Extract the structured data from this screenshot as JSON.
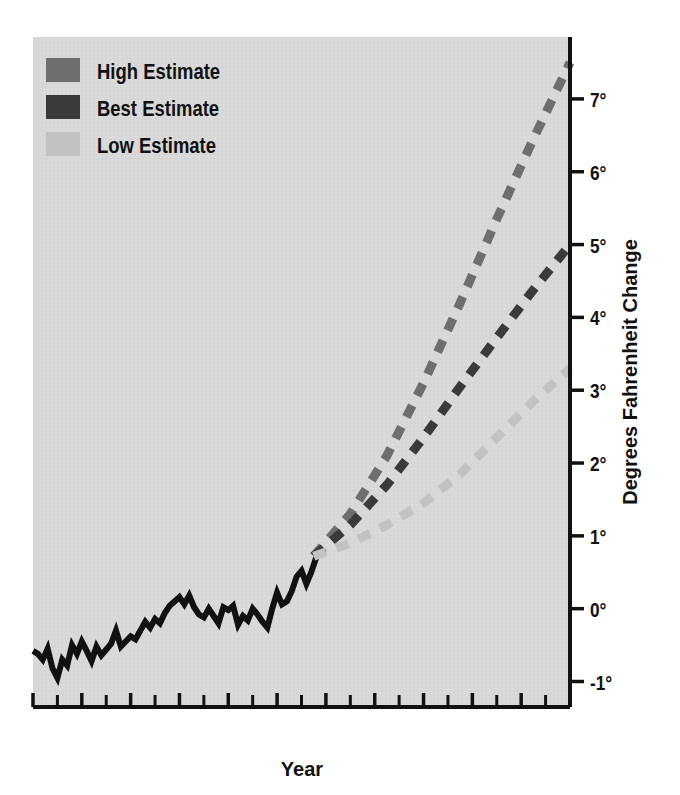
{
  "chart_data": {
    "type": "line",
    "title": "",
    "xlabel": "Year",
    "ylabel": "Degrees Fahrenheit Change",
    "xlim": [
      1880,
      2100
    ],
    "ylim": [
      -1.35,
      7.85
    ],
    "grid": false,
    "legend_position": "top-left",
    "background_color": "#d8d8d8",
    "x_tick_labels": [
      "1880",
      "1900",
      "'20",
      "'40",
      "'60",
      "'80",
      "2000",
      "'20",
      "'40",
      "'60",
      "'80",
      "2100"
    ],
    "x_tick_values": [
      1880,
      1900,
      1920,
      1940,
      1960,
      1980,
      2000,
      2020,
      2040,
      2060,
      2080,
      2100
    ],
    "x_minor_tick_values": [
      1890,
      1910,
      1930,
      1950,
      1970,
      1990,
      2010,
      2030,
      2050,
      2070,
      2090
    ],
    "y_tick_labels": [
      "-1°",
      "0°",
      "1°",
      "2°",
      "3°",
      "4°",
      "5°",
      "6°",
      "7°"
    ],
    "y_tick_values": [
      -1,
      0,
      1,
      2,
      3,
      4,
      5,
      6,
      7
    ],
    "series": [
      {
        "name": "Observed Record",
        "color": "#111111",
        "style": "solid",
        "width": 6,
        "in_legend": false,
        "x": [
          1880,
          1882,
          1884,
          1886,
          1888,
          1890,
          1892,
          1894,
          1896,
          1898,
          1900,
          1902,
          1904,
          1906,
          1908,
          1910,
          1912,
          1914,
          1916,
          1918,
          1920,
          1922,
          1924,
          1926,
          1928,
          1930,
          1932,
          1934,
          1936,
          1938,
          1940,
          1942,
          1944,
          1946,
          1948,
          1950,
          1952,
          1954,
          1956,
          1958,
          1960,
          1962,
          1964,
          1966,
          1968,
          1970,
          1972,
          1974,
          1976,
          1978,
          1980,
          1982,
          1984,
          1986,
          1988,
          1990,
          1992,
          1994,
          1996
        ],
        "values": [
          -0.58,
          -0.62,
          -0.7,
          -0.55,
          -0.82,
          -0.95,
          -0.7,
          -0.78,
          -0.5,
          -0.62,
          -0.45,
          -0.58,
          -0.72,
          -0.52,
          -0.64,
          -0.56,
          -0.48,
          -0.3,
          -0.52,
          -0.45,
          -0.38,
          -0.42,
          -0.3,
          -0.18,
          -0.26,
          -0.14,
          -0.2,
          -0.06,
          0.04,
          0.1,
          0.16,
          0.06,
          0.18,
          0.02,
          -0.08,
          -0.12,
          0.0,
          -0.1,
          -0.2,
          0.02,
          -0.02,
          0.04,
          -0.22,
          -0.1,
          -0.16,
          0.0,
          -0.08,
          -0.18,
          -0.26,
          0.0,
          0.22,
          0.06,
          0.1,
          0.24,
          0.44,
          0.52,
          0.34,
          0.5,
          0.7
        ]
      },
      {
        "name": "High Estimate",
        "color": "#6e6e6e",
        "style": "dashed",
        "width": 9,
        "in_legend": true,
        "x": [
          1995,
          2010,
          2025,
          2040,
          2055,
          2070,
          2085,
          2100
        ],
        "values": [
          0.72,
          1.3,
          2.1,
          3.1,
          4.2,
          5.35,
          6.45,
          7.5
        ]
      },
      {
        "name": "Best Estimate",
        "color": "#3a3a3a",
        "style": "dashed",
        "width": 9,
        "in_legend": true,
        "x": [
          1995,
          2010,
          2025,
          2040,
          2055,
          2070,
          2085,
          2100
        ],
        "values": [
          0.72,
          1.15,
          1.7,
          2.35,
          3.05,
          3.72,
          4.38,
          5.0
        ]
      },
      {
        "name": "Low Estimate",
        "color": "#c2c2c2",
        "style": "dashed",
        "width": 9,
        "in_legend": true,
        "x": [
          1995,
          2010,
          2025,
          2040,
          2055,
          2070,
          2085,
          2100
        ],
        "values": [
          0.72,
          0.9,
          1.15,
          1.45,
          1.85,
          2.35,
          2.85,
          3.3
        ]
      }
    ]
  },
  "legend": {
    "items": [
      {
        "label": "High Estimate",
        "color": "#6e6e6e"
      },
      {
        "label": "Best Estimate",
        "color": "#3a3a3a"
      },
      {
        "label": "Low Estimate",
        "color": "#c2c2c2"
      }
    ]
  },
  "axes": {
    "x_title": "Year",
    "y_title": "Degrees Fahrenheit Change"
  }
}
